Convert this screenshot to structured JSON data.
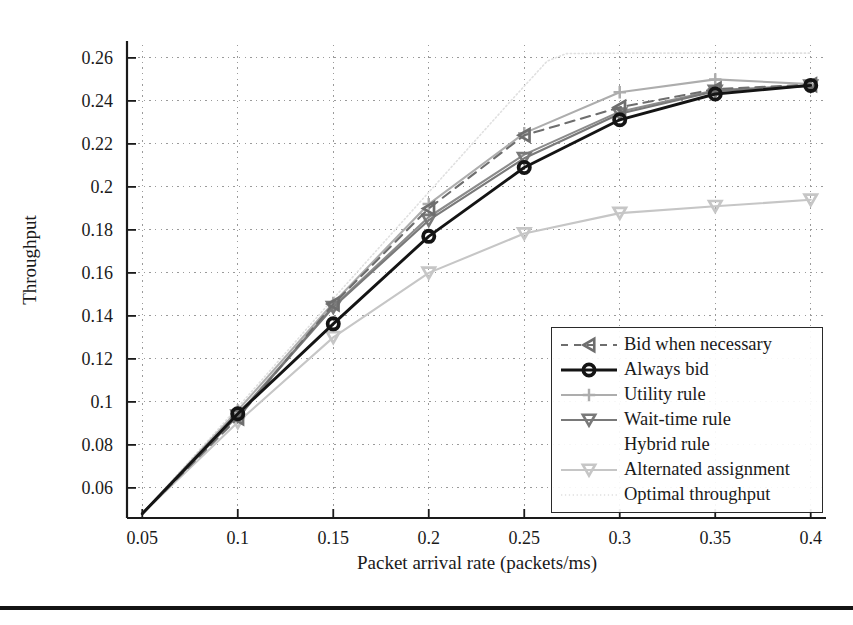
{
  "chart_data": {
    "type": "line",
    "title": "",
    "xlabel": "Packet arrival rate (packets/ms)",
    "ylabel": "Throughput",
    "x": [
      0.05,
      0.1,
      0.15,
      0.2,
      0.25,
      0.3,
      0.35,
      0.4
    ],
    "xticks": [
      "0.05",
      "0.1",
      "0.15",
      "0.2",
      "0.25",
      "0.3",
      "0.35",
      "0.4"
    ],
    "yticks": [
      "0.06",
      "0.08",
      "0.1",
      "0.12",
      "0.14",
      "0.16",
      "0.18",
      "0.2",
      "0.22",
      "0.24",
      "0.26"
    ],
    "xlim": [
      0.042,
      0.408
    ],
    "ylim": [
      0.046,
      0.266
    ],
    "grid": true,
    "grid_style": "dotted",
    "legend_position": "lower-right-inside",
    "series": [
      {
        "name": "Bid when necessary",
        "color": "#6e6e6e",
        "style": "dashed",
        "marker": "triangle-left",
        "values": [
          0.048,
          0.0925,
          0.1455,
          0.19,
          0.224,
          0.237,
          0.2455,
          0.2475
        ]
      },
      {
        "name": "Always bid",
        "color": "#141414",
        "style": "solid",
        "marker": "circle",
        "values": [
          0.048,
          0.0945,
          0.1363,
          0.177,
          0.209,
          0.2312,
          0.2432,
          0.2472
        ]
      },
      {
        "name": "Utility rule",
        "color": "#adadad",
        "style": "solid",
        "marker": "plus",
        "values": [
          0.048,
          0.096,
          0.146,
          0.192,
          0.225,
          0.244,
          0.25,
          0.2478
        ]
      },
      {
        "name": "Wait-time rule",
        "color": "#797979",
        "style": "solid",
        "marker": "triangle-down",
        "values": [
          0.048,
          0.0935,
          0.144,
          0.1845,
          0.2133,
          0.234,
          0.2445,
          0.247
        ]
      },
      {
        "name": "Hybrid rule",
        "color": "#8c8c8c",
        "style": "solid",
        "marker": "none",
        "values": [
          0.048,
          0.094,
          0.1445,
          0.186,
          0.215,
          0.235,
          0.245,
          0.2472
        ]
      },
      {
        "name": "Alternated assignment",
        "color": "#c6c6c6",
        "style": "solid",
        "marker": "triangle-down",
        "values": [
          0.048,
          0.0905,
          0.13,
          0.16,
          0.1783,
          0.1878,
          0.191,
          0.194
        ]
      },
      {
        "name": "Optimal throughput",
        "color": "#e0e0e0",
        "style": "dotted",
        "marker": "none",
        "values": [
          0.048,
          0.0975,
          0.148,
          0.1975,
          0.244,
          0.262,
          0.2622,
          0.2622
        ]
      }
    ]
  },
  "axis": {
    "ylabel": "Throughput",
    "xlabel": "Packet arrival rate (packets/ms)"
  },
  "legend": {
    "items": [
      {
        "label": "Bid when necessary"
      },
      {
        "label": "Always bid"
      },
      {
        "label": "Utility rule"
      },
      {
        "label": "Wait-time rule"
      },
      {
        "label": "Hybrid rule"
      },
      {
        "label": "Alternated assignment"
      },
      {
        "label": "Optimal throughput"
      }
    ]
  }
}
